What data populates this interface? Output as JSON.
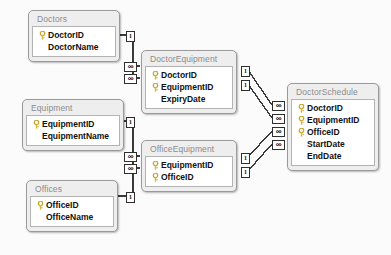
{
  "diagram": {
    "canvas_background": "#fbfbfb",
    "table_header_color": "#efeeee",
    "table_border_color": "#9a9a9a",
    "key_icon_color": "#d8b845",
    "connector_color": "#3a3a3a",
    "icons": {
      "primary_key": "key-icon"
    },
    "cardinality": {
      "one": "1",
      "many": "∞"
    },
    "tables": [
      {
        "id": "doctors",
        "name": "Doctors",
        "x": 28,
        "y": 10,
        "width": 92,
        "fields": [
          {
            "name": "DoctorID",
            "key": true
          },
          {
            "name": "DoctorName",
            "key": false
          }
        ]
      },
      {
        "id": "equipment",
        "name": "Equipment",
        "x": 22,
        "y": 99,
        "width": 102,
        "fields": [
          {
            "name": "EquipmentID",
            "key": true
          },
          {
            "name": "EquipmentName",
            "key": false
          }
        ]
      },
      {
        "id": "offices",
        "name": "Offices",
        "x": 26,
        "y": 180,
        "width": 92,
        "fields": [
          {
            "name": "OfficeID",
            "key": true
          },
          {
            "name": "OfficeName",
            "key": false
          }
        ]
      },
      {
        "id": "doctorequipment",
        "name": "DoctorEquipment",
        "x": 141,
        "y": 50,
        "width": 96,
        "fields": [
          {
            "name": "DoctorID",
            "key": true
          },
          {
            "name": "EquipmentID",
            "key": true
          },
          {
            "name": "ExpiryDate",
            "key": false
          }
        ]
      },
      {
        "id": "officeequipment",
        "name": "OfficeEquipment",
        "x": 141,
        "y": 140,
        "width": 96,
        "fields": [
          {
            "name": "EquipmentID",
            "key": true
          },
          {
            "name": "OfficeID",
            "key": true
          }
        ]
      },
      {
        "id": "doctorschedule",
        "name": "DoctorSchedule",
        "x": 287,
        "y": 83,
        "width": 92,
        "fields": [
          {
            "name": "DoctorID",
            "key": true
          },
          {
            "name": "EquipmentID",
            "key": true
          },
          {
            "name": "OfficeID",
            "key": true
          },
          {
            "name": "StartDate",
            "key": false
          },
          {
            "name": "EndDate",
            "key": false
          }
        ]
      }
    ],
    "relationships": [
      {
        "id": "rel-doctors-doctorequipment",
        "from": "Doctors",
        "to": "DoctorEquipment",
        "from_card": "1",
        "to_card": "∞"
      },
      {
        "id": "rel-doctors-doctorschedule",
        "from": "Doctors",
        "to": "DoctorSchedule",
        "from_card": "1",
        "to_card": "∞"
      },
      {
        "id": "rel-equipment-doctorequipment",
        "from": "Equipment",
        "to": "DoctorEquipment",
        "from_card": "1",
        "to_card": "∞"
      },
      {
        "id": "rel-equipment-officeequipment",
        "from": "Equipment",
        "to": "OfficeEquipment",
        "from_card": "1",
        "to_card": "∞"
      },
      {
        "id": "rel-offices-officeequipment",
        "from": "Offices",
        "to": "OfficeEquipment",
        "from_card": "1",
        "to_card": "∞"
      },
      {
        "id": "rel-doctorequipment-doctorschedule",
        "from": "DoctorEquipment",
        "to": "DoctorSchedule",
        "from_card": "1",
        "to_card": "∞"
      },
      {
        "id": "rel-officeequipment-doctorschedule",
        "from": "OfficeEquipment",
        "to": "DoctorSchedule",
        "from_card": "1",
        "to_card": "∞"
      }
    ],
    "badges": [
      {
        "id": "b1",
        "type": "one",
        "label": "1",
        "x": 126,
        "y": 31
      },
      {
        "id": "b2",
        "type": "many",
        "label": "∞",
        "x": 124,
        "y": 62
      },
      {
        "id": "b3",
        "type": "many",
        "label": "∞",
        "x": 124,
        "y": 74
      },
      {
        "id": "b4",
        "type": "one",
        "label": "1",
        "x": 126,
        "y": 117
      },
      {
        "id": "b5",
        "type": "many",
        "label": "∞",
        "x": 124,
        "y": 152
      },
      {
        "id": "b6",
        "type": "many",
        "label": "∞",
        "x": 124,
        "y": 164
      },
      {
        "id": "b7",
        "type": "one",
        "label": "1",
        "x": 126,
        "y": 192
      },
      {
        "id": "b8",
        "type": "one",
        "label": "1",
        "x": 241,
        "y": 66
      },
      {
        "id": "b9",
        "type": "one",
        "label": "1",
        "x": 241,
        "y": 80
      },
      {
        "id": "b10",
        "type": "one",
        "label": "1",
        "x": 241,
        "y": 153
      },
      {
        "id": "b11",
        "type": "one",
        "label": "1",
        "x": 241,
        "y": 167
      },
      {
        "id": "b12",
        "type": "many",
        "label": "∞",
        "x": 272,
        "y": 101
      },
      {
        "id": "b13",
        "type": "many",
        "label": "∞",
        "x": 272,
        "y": 114
      },
      {
        "id": "b14",
        "type": "many",
        "label": "∞",
        "x": 272,
        "y": 127
      },
      {
        "id": "b15",
        "type": "many",
        "label": "∞",
        "x": 272,
        "y": 140
      }
    ]
  }
}
